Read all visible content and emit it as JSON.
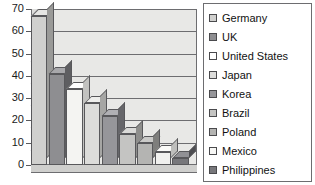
{
  "chart_data": {
    "type": "bar",
    "title": "",
    "subtitle": "",
    "xlabel": "",
    "ylabel": "",
    "ylim": [
      0,
      70
    ],
    "ytick_labels": [
      "70",
      "60",
      "50",
      "40",
      "30",
      "20",
      "10",
      "0"
    ],
    "yticks": [
      70,
      60,
      50,
      40,
      30,
      20,
      10,
      0
    ],
    "grid": true,
    "legend_position": "right",
    "style": "3d-bar",
    "categories": [
      "Germany",
      "UK",
      "United States",
      "Japan",
      "Korea",
      "Brazil",
      "Poland",
      "Mexico",
      "Philippines"
    ],
    "values": [
      67,
      41,
      34,
      28,
      22,
      14,
      10,
      6,
      3
    ],
    "bar_colors": [
      "#d0d0ce",
      "#8e8e91",
      "#f4f4f2",
      "#dcdcda",
      "#96969a",
      "#c4c4c2",
      "#b4b4b2",
      "#f0f0ee",
      "#77777b"
    ],
    "bar_top_colors": [
      "#e6e6e4",
      "#a8a8ab",
      "#ffffff",
      "#eeeeec",
      "#b0b0b4",
      "#dadad8",
      "#cacac8",
      "#fafaf8",
      "#919195"
    ],
    "bar_side_colors": [
      "#9a9a98",
      "#5e5e61",
      "#c2c2c0",
      "#a6a6a4",
      "#66666a",
      "#8e8e8c",
      "#7e7e7c",
      "#bebebc",
      "#4d4d51"
    ]
  },
  "legend": {
    "items": [
      {
        "label": "Germany",
        "color": "#d0d0ce"
      },
      {
        "label": "UK",
        "color": "#8e8e91"
      },
      {
        "label": "United States",
        "color": "#ffffff"
      },
      {
        "label": "Japan",
        "color": "#dcdcda"
      },
      {
        "label": "Korea",
        "color": "#96969a"
      },
      {
        "label": "Brazil",
        "color": "#c4c4c2"
      },
      {
        "label": "Poland",
        "color": "#b4b4b2"
      },
      {
        "label": "Mexico",
        "color": "#f7f7f5"
      },
      {
        "label": "Philippines",
        "color": "#77777b"
      }
    ]
  }
}
